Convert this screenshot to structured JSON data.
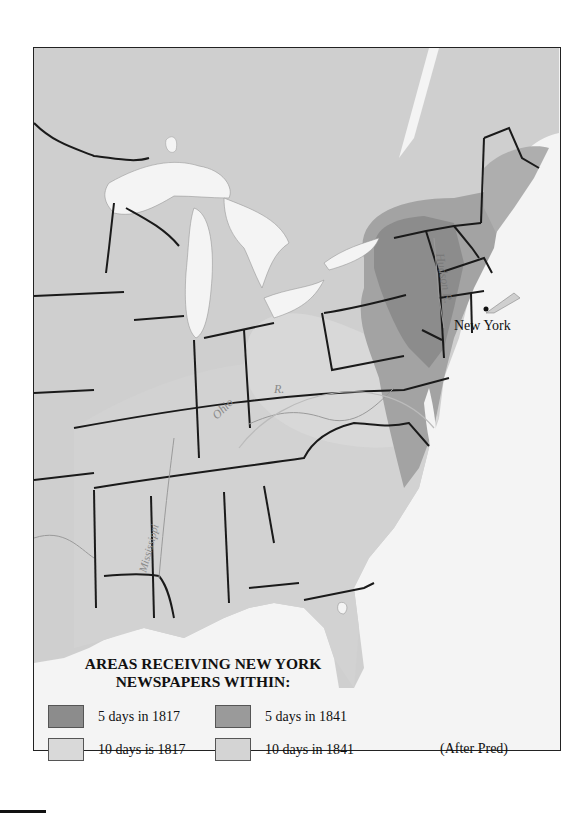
{
  "map": {
    "city_label": "New York",
    "river_labels": [
      "Hudson R.",
      "Ohio R.",
      "Mississippi R."
    ],
    "colors": {
      "land": "#cfcfcf",
      "water": "#f4f4f4",
      "borders": "#1a1a1a",
      "five_days_1817": "#8c8c8c",
      "ten_days_1817": "#d9d9d9",
      "five_days_1841": "#9a9a9a",
      "ten_days_1841": "#d4d4d4"
    }
  },
  "legend": {
    "title_line1": "AREAS RECEIVING NEW YORK",
    "title_line2": "NEWSPAPERS WITHIN:",
    "items": [
      {
        "label": "5 days in 1817",
        "color": "#8c8c8c"
      },
      {
        "label": "5 days in 1841",
        "color": "#9a9a9a"
      },
      {
        "label": "10 days is 1817",
        "color": "#d9d9d9"
      },
      {
        "label": "10 days in 1841",
        "color": "#d4d4d4"
      }
    ],
    "credit": "(After Pred)"
  }
}
